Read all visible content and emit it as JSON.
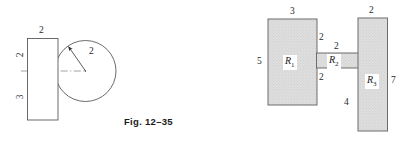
{
  "figure": {
    "caption": "Fig. 12–35",
    "left_diagram": {
      "name": "rectangle-and-circle",
      "rectangle": {
        "top_label": "2",
        "left_upper_label": "2",
        "left_lower_label": "3"
      },
      "circle": {
        "radius_label": "2"
      },
      "centerline": "dash-dot horizontal axis"
    },
    "right_diagram": {
      "name": "three-region-composite",
      "regions": [
        {
          "id": "R1",
          "label": "R",
          "subscript": "1",
          "top_label": "3",
          "left_label": "5"
        },
        {
          "id": "R2",
          "label": "R",
          "subscript": "2",
          "top_label": "2",
          "left_label": "2",
          "bottom_label": "2"
        },
        {
          "id": "R3",
          "label": "R",
          "subscript": "3",
          "top_label": "2",
          "right_label": "7",
          "left_label": "4"
        }
      ]
    }
  },
  "colors": {
    "stroke": "#555555",
    "fill": "#dcdcdc",
    "hatch": "#c9c9c9",
    "background": "#ffffff",
    "text": "#2a2a2a"
  }
}
